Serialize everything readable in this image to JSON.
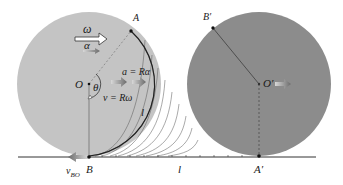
{
  "figure": {
    "left_wheel": {
      "center_label": "O",
      "top_point_label": "A",
      "bottom_point_label": "B",
      "angle_label": "θ",
      "omega_label": "ω",
      "alpha_label": "α",
      "accel_label": "a = Rα",
      "velocity_label": "v = Rω",
      "arc_length_label": "l",
      "contact_velocity_label": "v",
      "contact_velocity_subscript": "BO",
      "fill_color": "#c4c4c4"
    },
    "right_wheel": {
      "center_label": "O′",
      "top_point_label": "B′",
      "bottom_point_label": "A′",
      "fill_color": "#8c8c8c"
    },
    "ground": {
      "distance_label": "l"
    }
  }
}
